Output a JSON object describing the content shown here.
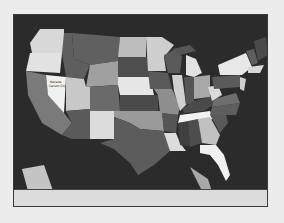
{
  "map": {
    "title": "",
    "labels": {
      "nevada": "Nevada",
      "nevada_sub": "Carson City"
    },
    "background_color": "#2b2b2b",
    "page_color": "#ececec",
    "strip_color": "#dcdcdc"
  }
}
